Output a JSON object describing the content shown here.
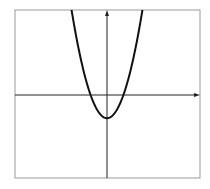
{
  "chart_data": {
    "type": "line",
    "title": "",
    "xlabel": "",
    "ylabel": "",
    "function": "y = x^2 - 2",
    "series": [
      {
        "name": "parabola",
        "x": [
          -3.05,
          -2.5,
          -2,
          -1.5,
          -1.414,
          -1,
          -0.5,
          0,
          0.5,
          1,
          1.414,
          1.5,
          2,
          2.5,
          3.05
        ],
        "values": [
          7.3,
          4.25,
          2,
          0.25,
          0,
          -1,
          -1.75,
          -2,
          -1.75,
          -1,
          0,
          0.25,
          2,
          4.25,
          7.3
        ]
      }
    ],
    "vertex": [
      0,
      -2
    ],
    "roots": [
      -1.414,
      1.414
    ],
    "xlim": [
      -7.9,
      8.0
    ],
    "ylim": [
      -7.2,
      7.3
    ],
    "grid": false,
    "legend": null,
    "axes_arrows": true,
    "tick_labels": []
  },
  "colors": {
    "curve": "#111111",
    "axes": "#222222",
    "frame": "#999999",
    "background": "#ffffff"
  }
}
